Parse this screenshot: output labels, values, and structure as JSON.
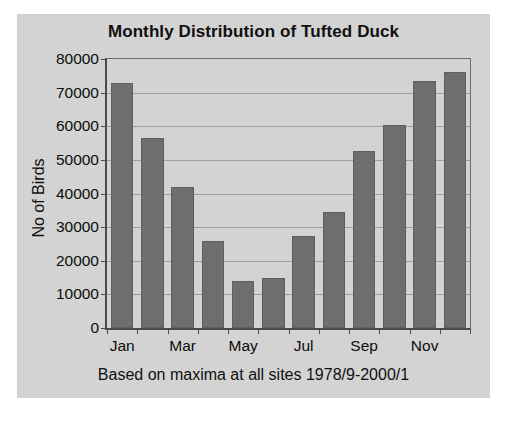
{
  "chart_data": {
    "type": "bar",
    "title": "Monthly Distribution of Tufted Duck",
    "subtitle": "Based on maxima at all sites 1978/9-2000/1",
    "xlabel": "",
    "ylabel": "No of Birds",
    "ylim": [
      0,
      80000
    ],
    "ytick_step": 10000,
    "yticks": [
      "80000",
      "70000",
      "60000",
      "50000",
      "40000",
      "30000",
      "20000",
      "10000",
      "0"
    ],
    "grid": true,
    "legend": false,
    "bar_color": "#6e6e6e",
    "panel_color": "#d3d3d3",
    "categories": [
      "Jan",
      "Feb",
      "Mar",
      "Apr",
      "May",
      "Jun",
      "Jul",
      "Aug",
      "Sep",
      "Oct",
      "Nov",
      "Dec"
    ],
    "visible_tick_labels": [
      "Jan",
      "",
      "Mar",
      "",
      "May",
      "",
      "Jul",
      "",
      "Sep",
      "",
      "Nov",
      ""
    ],
    "values": [
      73000,
      56500,
      42000,
      26000,
      14000,
      15000,
      27500,
      34500,
      52500,
      60500,
      73500,
      76000
    ]
  }
}
